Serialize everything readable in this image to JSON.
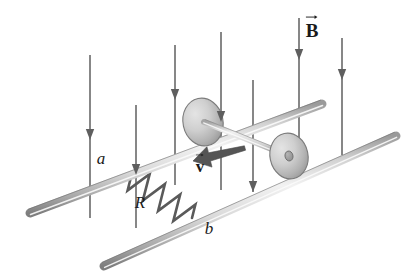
{
  "figure": {
    "type": "physics-diagram",
    "background_color": "#ffffff",
    "ink_color": "#4a4a4a",
    "label_color": "#1a1a1a",
    "rail_fill_light": "#ededed",
    "rail_fill_mid": "#cfcfcf",
    "rail_fill_dark": "#8e8e8e",
    "wheel_fill_light": "#dcdcdc",
    "wheel_fill_dark": "#a0a0a0"
  },
  "labels": {
    "field": {
      "symbol": "B",
      "text": "B",
      "style": "bold-vector",
      "x": 312,
      "y": 30
    },
    "velocity": {
      "symbol": "v",
      "text": "v",
      "style": "bold-vector",
      "x": 200,
      "y": 166
    },
    "rail_top": {
      "text": "a",
      "style": "italic",
      "x": 101,
      "y": 158
    },
    "rail_bottom": {
      "text": "b",
      "style": "italic",
      "x": 209,
      "y": 228
    },
    "resistor": {
      "text": "R",
      "style": "italic",
      "x": 140,
      "y": 202
    }
  },
  "field_lines": {
    "count": 7,
    "direction": "down",
    "lines": [
      {
        "x": 90,
        "y_top": 55,
        "y_bottom": 218,
        "arrow_y": 140
      },
      {
        "x": 136,
        "y_top": 105,
        "y_bottom": 228,
        "arrow_y": 175
      },
      {
        "x": 175,
        "y_top": 45,
        "y_bottom": 185,
        "arrow_y": 100
      },
      {
        "x": 221,
        "y_top": 32,
        "y_bottom": 190,
        "arrow_y": 122
      },
      {
        "x": 253,
        "y_top": 80,
        "y_bottom": 192,
        "arrow_y": 192
      },
      {
        "x": 299,
        "y_top": 18,
        "y_bottom": 178,
        "arrow_y": 60
      },
      {
        "x": 342,
        "y_top": 38,
        "y_bottom": 155,
        "arrow_y": 80
      }
    ]
  },
  "rails": {
    "top": {
      "name": "a",
      "x1": 30,
      "y1": 213,
      "x2": 322,
      "y2": 104,
      "thickness": 9
    },
    "bottom": {
      "name": "b",
      "x1": 104,
      "y1": 266,
      "x2": 396,
      "y2": 136,
      "thickness": 9
    }
  },
  "rod": {
    "description": "conducting rod with wheels at each end",
    "axle": {
      "x1": 204,
      "y1": 122,
      "x2": 289,
      "y2": 156,
      "thickness": 6
    },
    "wheels": [
      {
        "position": "left",
        "cx": 203,
        "cy": 122,
        "rx": 20,
        "ry": 24,
        "rotation": -12,
        "hub": false
      },
      {
        "position": "right",
        "cx": 289,
        "cy": 156,
        "rx": 19,
        "ry": 23,
        "rotation": -12,
        "hub": true,
        "hub_rx": 4,
        "hub_ry": 5
      }
    ]
  },
  "resistor": {
    "label": "R",
    "zigzag_peaks": 4,
    "x1": 131,
    "y1": 177,
    "x2": 192,
    "y2": 218
  },
  "velocity_arrow": {
    "x1": 245,
    "y1": 148,
    "x2": 193,
    "y2": 161,
    "style": "thick-tapered"
  }
}
